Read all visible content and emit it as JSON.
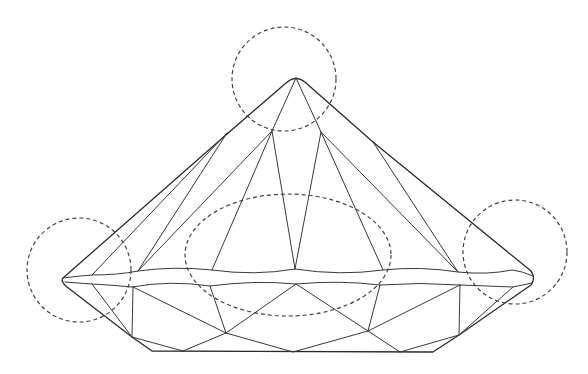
{
  "diagram": {
    "title": "",
    "colors": {
      "background": "#ffffff",
      "line": "#3a3a3a",
      "highlight": "#444444"
    },
    "highlights": [
      {
        "name": "culet-highlight",
        "shape": "circle",
        "cx": 284,
        "cy": 79,
        "r": 52
      },
      {
        "name": "left-girdle-highlight",
        "shape": "circle",
        "cx": 79,
        "cy": 270,
        "r": 52
      },
      {
        "name": "right-girdle-highlight",
        "shape": "circle",
        "cx": 515,
        "cy": 252,
        "r": 52
      },
      {
        "name": "center-girdle-highlight",
        "shape": "ellipse",
        "cx": 288,
        "cy": 255,
        "rx": 103,
        "ry": 61
      }
    ]
  }
}
